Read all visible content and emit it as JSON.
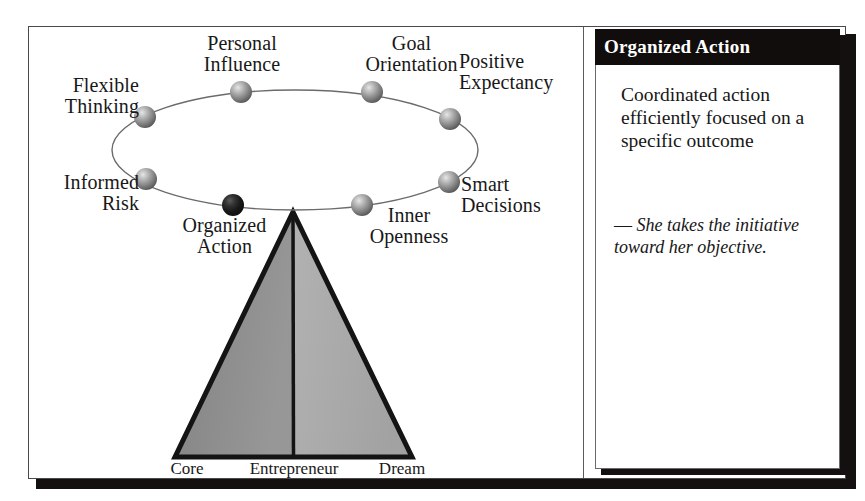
{
  "figure": {
    "background_color": "#ffffff",
    "frame_color": "#4a4a4a",
    "shadow_color": "#14100f"
  },
  "diagram": {
    "type": "conceptual-diagram",
    "ellipse": {
      "center_x": 266,
      "center_y": 123,
      "radius_x": 183,
      "radius_y": 60,
      "stroke_color": "#6b6b6b"
    },
    "attributes": [
      {
        "id": "flexible-thinking",
        "label": "Flexible\nThinking",
        "highlighted": false,
        "node_x": 116,
        "node_y": 90,
        "label_x": 2,
        "label_y": 48,
        "label_width": 108,
        "align": "r"
      },
      {
        "id": "personal-influence",
        "label": "Personal\nInfluence",
        "highlighted": false,
        "node_x": 212,
        "node_y": 65,
        "label_x": 128,
        "label_y": 6,
        "label_width": 170,
        "align": "c"
      },
      {
        "id": "goal-orientation",
        "label": "Goal\nOrientation",
        "highlighted": false,
        "node_x": 343,
        "node_y": 65,
        "label_x": 300,
        "label_y": 6,
        "label_width": 165,
        "align": "c"
      },
      {
        "id": "positive-expectancy",
        "label": "Positive\nExpectancy",
        "highlighted": false,
        "node_x": 421,
        "node_y": 92,
        "label_x": 430,
        "label_y": 24,
        "label_width": 130,
        "align": "l"
      },
      {
        "id": "smart-decisions",
        "label": "Smart\nDecisions",
        "highlighted": false,
        "node_x": 420,
        "node_y": 155,
        "label_x": 432,
        "label_y": 147,
        "label_width": 120,
        "align": "l"
      },
      {
        "id": "inner-openness",
        "label": "Inner\nOpenness",
        "highlighted": false,
        "node_x": 333,
        "node_y": 178,
        "label_x": 310,
        "label_y": 178,
        "label_width": 140,
        "align": "c"
      },
      {
        "id": "organized-action",
        "label": "Organized\nAction",
        "highlighted": true,
        "node_x": 204,
        "node_y": 178,
        "label_x": 118,
        "label_y": 188,
        "label_width": 155,
        "align": "c"
      },
      {
        "id": "informed-risk",
        "label": "Informed\nRisk",
        "highlighted": false,
        "node_x": 117,
        "node_y": 152,
        "label_x": 0,
        "label_y": 145,
        "label_width": 110,
        "align": "r"
      }
    ],
    "pyramid": {
      "apex_x": 264,
      "apex_y": 185,
      "base_left_x": 146,
      "base_right_x": 383,
      "base_y": 430,
      "left_fill": "#8d8d8d",
      "right_fill": "#aaaaaa",
      "outline_color": "#141414",
      "base_labels": [
        {
          "id": "core",
          "label": "Core",
          "x": 118,
          "y": 432,
          "width": 80
        },
        {
          "id": "entrepreneur",
          "label": "Entrepreneur",
          "x": 202,
          "y": 432,
          "width": 126
        },
        {
          "id": "dream",
          "label": "Dream",
          "x": 330,
          "y": 432,
          "width": 86
        }
      ]
    }
  },
  "detail_card": {
    "header_title": "Organized Action",
    "definition": "Coordinated action efficiently focused on a specific outcome",
    "quote_dash": "—",
    "quote_text": "She takes the initiative toward her objective."
  }
}
